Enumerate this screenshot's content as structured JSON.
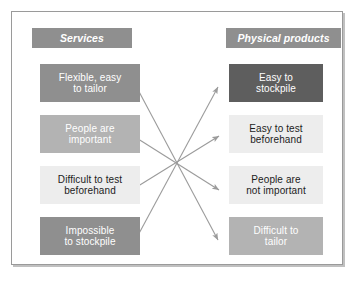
{
  "diagram": {
    "title_left": "Services",
    "title_right": "Physical products",
    "accent_mid": "#8f8f8f",
    "accent_light": "#b3b3b3",
    "accent_pale": "#ededed",
    "accent_dark": "#5e5e5e",
    "arrow_color": "#9b9b9b",
    "frame_color": "#9a9a9a",
    "hub": {
      "x": 177,
      "y": 163
    },
    "left_items": [
      {
        "text": "Flexible, easy\nto tailor",
        "tone": "tone-mid"
      },
      {
        "text": "People are\nimportant",
        "tone": "tone-light"
      },
      {
        "text": "Difficult to test\nbeforehand",
        "tone": "tone-pale"
      },
      {
        "text": "Impossible\nto stockpile",
        "tone": "tone-mid"
      }
    ],
    "right_items": [
      {
        "text": "Easy to\nstockpile",
        "tone": "tone-dark"
      },
      {
        "text": "Easy to test\nbeforehand",
        "tone": "tone-pale"
      },
      {
        "text": "People are\nnot important",
        "tone": "tone-pale"
      },
      {
        "text": "Difficult to\ntailor",
        "tone": "tone-light"
      }
    ],
    "connections": [
      {
        "from": "left-item-0",
        "to": "right-item-3"
      },
      {
        "from": "left-item-1",
        "to": "right-item-2"
      },
      {
        "from": "left-item-2",
        "to": "right-item-1"
      },
      {
        "from": "left-item-3",
        "to": "right-item-0"
      }
    ]
  }
}
